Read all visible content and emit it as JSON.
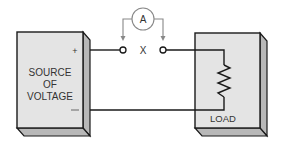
{
  "diagram": {
    "source": {
      "label_lines": [
        "SOURCE",
        "OF",
        "VOLTAGE"
      ],
      "positive": "+",
      "negative": "—"
    },
    "load": {
      "label": "LOAD"
    },
    "meter": {
      "symbol": "A",
      "name": "ammeter"
    },
    "gap_label": "X"
  },
  "colors": {
    "box_face": "#e4e4e4",
    "box_side": "#b8b8b8",
    "stroke": "#1a1a1a",
    "meter_stroke": "#888888",
    "text": "#333333"
  }
}
